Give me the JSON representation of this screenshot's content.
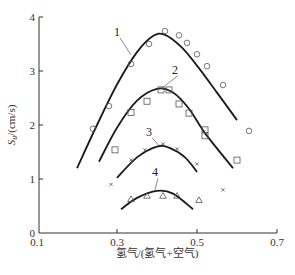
{
  "chart_data": {
    "type": "scatter",
    "title": "",
    "xlabel": "氢气/(氢气+空气)",
    "ylabel": "S_u/(cm/s)",
    "ylabel_main": "S",
    "ylabel_sub": "u",
    "ylabel_unit": "/(cm/s)",
    "xlim": [
      0.1,
      0.7
    ],
    "ylim": [
      0,
      4
    ],
    "xticks": [
      0.1,
      0.3,
      0.5,
      0.7
    ],
    "xtick_labels": [
      "0.1",
      "0.3",
      "0.5",
      "0.7"
    ],
    "yticks": [
      0,
      1,
      2,
      3,
      4
    ],
    "ytick_labels": [
      "0",
      "1",
      "2",
      "3",
      "4"
    ],
    "grid": false,
    "legend": "curve number labels 1-4 with leader lines",
    "series": [
      {
        "name": "1",
        "marker": "circle",
        "points": [
          [
            0.24,
            1.93
          ],
          [
            0.28,
            2.35
          ],
          [
            0.335,
            3.13
          ],
          [
            0.38,
            3.5
          ],
          [
            0.42,
            3.74
          ],
          [
            0.455,
            3.66
          ],
          [
            0.475,
            3.52
          ],
          [
            0.5,
            3.31
          ],
          [
            0.525,
            3.09
          ],
          [
            0.565,
            2.74
          ],
          [
            0.63,
            1.89
          ]
        ],
        "fit_curve": [
          [
            0.2,
            1.2
          ],
          [
            0.25,
            2.0
          ],
          [
            0.3,
            2.75
          ],
          [
            0.35,
            3.35
          ],
          [
            0.39,
            3.65
          ],
          [
            0.42,
            3.67
          ],
          [
            0.46,
            3.45
          ],
          [
            0.5,
            3.1
          ],
          [
            0.55,
            2.6
          ],
          [
            0.6,
            2.09
          ]
        ]
      },
      {
        "name": "2",
        "marker": "square",
        "points": [
          [
            0.295,
            1.54
          ],
          [
            0.335,
            2.23
          ],
          [
            0.375,
            2.44
          ],
          [
            0.41,
            2.65
          ],
          [
            0.43,
            2.65
          ],
          [
            0.455,
            2.39
          ],
          [
            0.48,
            2.22
          ],
          [
            0.52,
            1.91
          ],
          [
            0.52,
            1.8
          ],
          [
            0.6,
            1.35
          ]
        ],
        "fit_curve": [
          [
            0.255,
            1.32
          ],
          [
            0.3,
            1.95
          ],
          [
            0.35,
            2.45
          ],
          [
            0.4,
            2.67
          ],
          [
            0.44,
            2.6
          ],
          [
            0.48,
            2.3
          ],
          [
            0.52,
            1.85
          ],
          [
            0.59,
            1.2
          ]
        ]
      },
      {
        "name": "3",
        "marker": "cross",
        "points": [
          [
            0.285,
            0.9
          ],
          [
            0.335,
            1.35
          ],
          [
            0.37,
            1.54
          ],
          [
            0.415,
            1.65
          ],
          [
            0.45,
            1.56
          ],
          [
            0.5,
            1.28
          ],
          [
            0.565,
            0.8
          ]
        ],
        "fit_curve": [
          [
            0.3,
            1.02
          ],
          [
            0.35,
            1.4
          ],
          [
            0.4,
            1.6
          ],
          [
            0.43,
            1.58
          ],
          [
            0.47,
            1.4
          ],
          [
            0.5,
            1.13
          ]
        ]
      },
      {
        "name": "4",
        "marker": "triangle",
        "points": [
          [
            0.335,
            0.63
          ],
          [
            0.375,
            0.69
          ],
          [
            0.415,
            0.69
          ],
          [
            0.45,
            0.69
          ],
          [
            0.505,
            0.61
          ]
        ],
        "fit_curve": [
          [
            0.31,
            0.44
          ],
          [
            0.35,
            0.65
          ],
          [
            0.4,
            0.78
          ],
          [
            0.44,
            0.73
          ],
          [
            0.49,
            0.44
          ]
        ]
      }
    ],
    "curve_labels": [
      {
        "text": "1",
        "x": 0.3,
        "y": 3.65,
        "leader_to": [
          0.335,
          3.3
        ]
      },
      {
        "text": "2",
        "x": 0.445,
        "y": 2.95,
        "leader_to": [
          0.41,
          2.67
        ]
      },
      {
        "text": "3",
        "x": 0.38,
        "y": 1.8,
        "leader_to": [
          0.405,
          1.62
        ]
      },
      {
        "text": "4",
        "x": 0.395,
        "y": 1.05,
        "leader_to": [
          0.395,
          0.8
        ]
      }
    ]
  }
}
